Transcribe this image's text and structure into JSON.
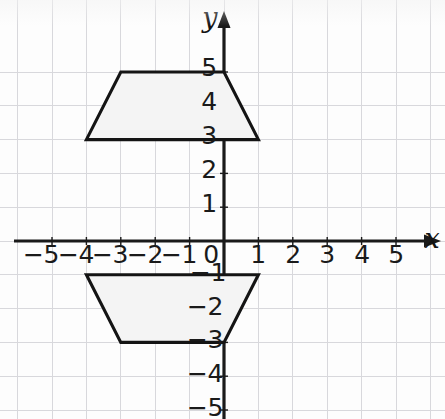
{
  "figure": {
    "kind": "coordinate-plane",
    "background_color": "#fdfdfd",
    "grid_color": "#d8d8dc",
    "axis_color": "#1a1a1a",
    "shape_stroke_color": "#141414",
    "shape_fill_color": "#f4f4f4"
  },
  "axes": {
    "x_label": "x",
    "y_label": "y",
    "x_ticks": [
      "−5",
      "−4",
      "−3",
      "−2",
      "−1",
      "0",
      "1",
      "2",
      "3",
      "4",
      "5"
    ],
    "y_ticks": [
      "5",
      "4",
      "3",
      "2",
      "1",
      "−1",
      "−2",
      "−3",
      "−4",
      "−5"
    ],
    "origin_label": "0",
    "x_range": [
      -6,
      6
    ],
    "y_range": [
      -5.3,
      5.6
    ],
    "grid": true,
    "arrows": [
      "x-positive",
      "y-positive"
    ]
  },
  "chart_data": {
    "type": "scatter",
    "title": "",
    "xlabel": "x",
    "ylabel": "y",
    "xlim": [
      -6,
      6
    ],
    "ylim": [
      -5.3,
      5.6
    ],
    "grid": true,
    "x_ticks": [
      -5,
      -4,
      -3,
      -2,
      -1,
      0,
      1,
      2,
      3,
      4,
      5
    ],
    "y_ticks": [
      5,
      4,
      3,
      2,
      1,
      -1,
      -2,
      -3,
      -4,
      -5
    ],
    "series": [
      {
        "name": "upper-trapezoid",
        "type": "polygon",
        "vertices": [
          [
            -3,
            5
          ],
          [
            0,
            5
          ],
          [
            1,
            3
          ],
          [
            -4,
            3
          ]
        ],
        "closed": true
      },
      {
        "name": "lower-trapezoid",
        "type": "polygon",
        "vertices": [
          [
            -4,
            -1
          ],
          [
            1,
            -1
          ],
          [
            0,
            -3
          ],
          [
            -3,
            -3
          ]
        ],
        "closed": true
      }
    ]
  },
  "shapes": [
    {
      "name": "upper-trapezoid",
      "vertices_text": "(−3, 5), (0, 5), (1, 3), (−4, 3)"
    },
    {
      "name": "lower-trapezoid",
      "vertices_text": "(−4, −1), (1, −1), (0, −3), (−3, −3)"
    }
  ]
}
